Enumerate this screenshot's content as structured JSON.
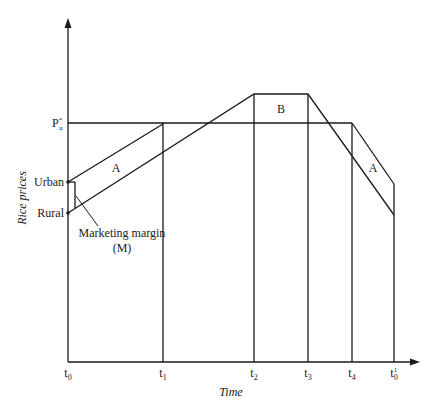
{
  "diagram": {
    "axes": {
      "y_label": "Rice prices",
      "x_label": "Time"
    },
    "y_ticks": {
      "p_u_star": {
        "base": "P",
        "sup": "*",
        "sub": "u"
      },
      "urban": "Urban",
      "rural": "Rural"
    },
    "x_ticks": [
      {
        "base": "t",
        "sub": "0",
        "sup": ""
      },
      {
        "base": "t",
        "sub": "1",
        "sup": ""
      },
      {
        "base": "t",
        "sub": "2",
        "sup": ""
      },
      {
        "base": "t",
        "sub": "3",
        "sup": ""
      },
      {
        "base": "t",
        "sub": "4",
        "sup": ""
      },
      {
        "base": "t",
        "sub": "0",
        "sup": "1"
      }
    ],
    "regions": {
      "a_left": "A",
      "b": "B",
      "a_right": "A"
    },
    "annotation": {
      "line1": "Marketing margin",
      "line2": "(M)"
    }
  }
}
